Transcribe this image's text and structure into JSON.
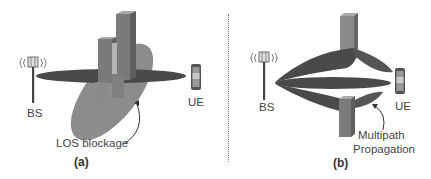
{
  "figure": {
    "panels": [
      {
        "id": "a",
        "caption": "(a)",
        "bs_label": "BS",
        "ue_label": "UE",
        "annotation": "LOS blockage",
        "elements": [
          "base-station-antenna",
          "main-beam-lobe",
          "blockage-shadow-ellipse",
          "building-cluster",
          "user-equipment-phone"
        ]
      },
      {
        "id": "b",
        "caption": "(b)",
        "bs_label": "BS",
        "ue_label": "UE",
        "annotation_line1": "Multipath",
        "annotation_line2": "Propagation",
        "elements": [
          "base-station-antenna",
          "direct-beam-lobe",
          "upper-reflected-beam-lobe",
          "lower-reflected-beam-lobe",
          "upper-building",
          "lower-building",
          "user-equipment-phone"
        ]
      }
    ],
    "colors": {
      "beam": "#4a4a4a",
      "shadow": "#8c8c8c",
      "building": "#7a7a7a",
      "building_light": "#a8a8a8",
      "text": "#444444"
    }
  }
}
